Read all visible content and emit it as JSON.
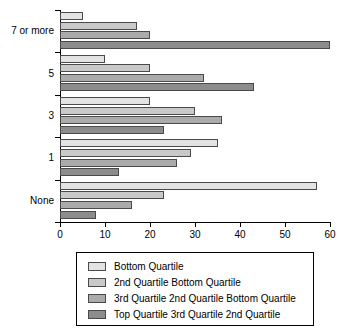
{
  "chart_data": {
    "type": "bar",
    "orientation": "horizontal",
    "title": "",
    "xlabel": "",
    "ylabel": "",
    "categories": [
      "None",
      "1",
      "3",
      "5",
      "7 or more"
    ],
    "category_order_top_to_bottom": [
      "7 or more",
      "5",
      "3",
      "1",
      "None"
    ],
    "xlim": [
      0,
      60
    ],
    "xticks": [
      0,
      10,
      20,
      30,
      40,
      50,
      60
    ],
    "xtick_labels": [
      "0",
      "10",
      "20",
      "30",
      "40",
      "50",
      "60"
    ],
    "grid": false,
    "legend_position": "bottom",
    "series": [
      {
        "name": "Bottom Quartile",
        "color": "#e3e3e3",
        "values": [
          57,
          35,
          20,
          10,
          5
        ]
      },
      {
        "name": "2nd Quartile Bottom Quartile",
        "color": "#c9c9c9",
        "values": [
          23,
          29,
          30,
          20,
          17
        ]
      },
      {
        "name": "3rd Quartile 2nd Quartile Bottom Quartile",
        "color": "#ababab",
        "values": [
          16,
          26,
          36,
          32,
          20
        ]
      },
      {
        "name": "Top Quartile 3rd Quartile 2nd Quartile",
        "color": "#8c8c8c",
        "values": [
          8,
          13,
          23,
          43,
          60
        ]
      }
    ]
  },
  "legend": {
    "items": [
      {
        "label": "Bottom Quartile",
        "color": "#e3e3e3"
      },
      {
        "label": "2nd Quartile Bottom Quartile",
        "color": "#c9c9c9"
      },
      {
        "label": "3rd Quartile 2nd Quartile Bottom Quartile",
        "color": "#ababab"
      },
      {
        "label": "Top Quartile 3rd Quartile 2nd Quartile",
        "color": "#8c8c8c"
      }
    ]
  },
  "axis": {
    "line_color": "#000000",
    "bar_edge_color": "#4a4a4a"
  }
}
